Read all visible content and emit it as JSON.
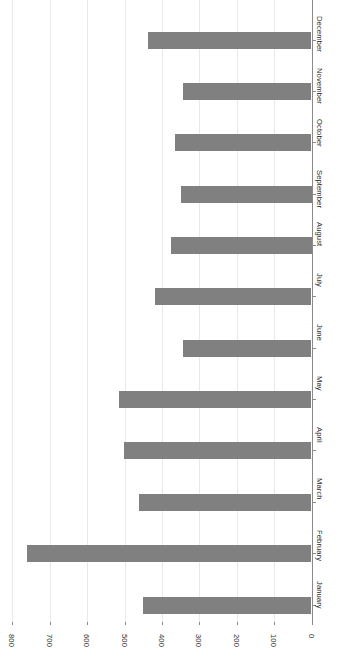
{
  "chart_data": {
    "type": "bar",
    "orientation": "horizontal",
    "title": "",
    "subtitle": "",
    "xlabel": "",
    "ylabel": "",
    "categories": [
      "January",
      "February",
      "March",
      "April",
      "May",
      "June",
      "July",
      "August",
      "September",
      "October",
      "November",
      "December"
    ],
    "values": [
      451,
      761,
      462,
      501,
      515,
      344,
      419,
      375,
      349,
      366,
      344,
      438
    ],
    "axis": {
      "tick_labels": [
        "800",
        "700",
        "600",
        "500",
        "400",
        "300",
        "200",
        "100",
        "0"
      ],
      "tick_values": [
        800,
        700,
        600,
        500,
        400,
        300,
        200,
        100,
        0
      ],
      "range": [
        0,
        830
      ],
      "direction": "right-to-left",
      "grid": true,
      "grid_axis": "value"
    },
    "legend": {
      "visible": false,
      "entries": []
    },
    "bar_color": "#808080",
    "grid_color": "#e9e9e9",
    "axis_color": "#8a8a8a",
    "background_color": "#ffffff",
    "label_rotation_degrees": 90
  }
}
